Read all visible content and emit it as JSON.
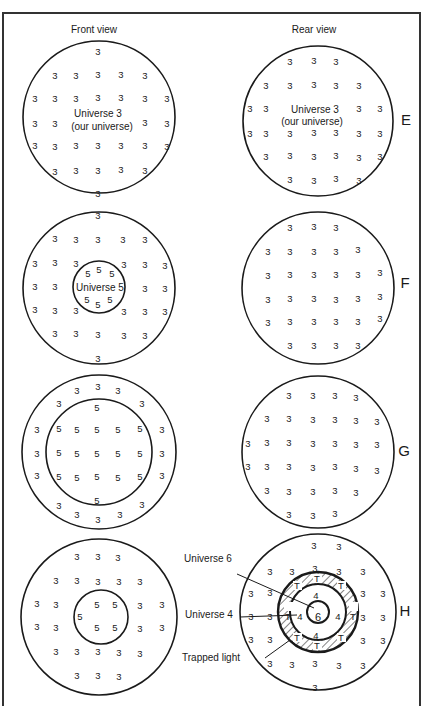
{
  "headers": {
    "front": "Front view",
    "rear": "Rear view"
  },
  "rows": [
    {
      "letter": "E",
      "front": {
        "label_line1": "Universe 3",
        "label_line2": "(our universe)"
      },
      "rear": {
        "label_line1": "Universe 3",
        "label_line2": "(our universe)"
      }
    },
    {
      "letter": "F",
      "front": {
        "inner_label": "Universe 5"
      },
      "rear": {}
    },
    {
      "letter": "G"
    },
    {
      "letter": "H",
      "annotations": {
        "universe6": "Universe 6",
        "universe4": "Universe 4",
        "trapped": "Trapped light"
      }
    }
  ],
  "symbols": {
    "u3": "3",
    "u4": "4",
    "u5": "5",
    "u6": "6",
    "trapped": "T"
  },
  "colors": {
    "ink": "#1a1a1a",
    "frame": "#333333",
    "background": "#ffffff"
  }
}
